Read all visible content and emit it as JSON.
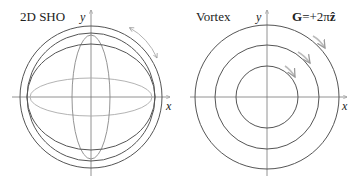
{
  "panels": [
    {
      "title": "2D SHO",
      "x_axis_label": "x",
      "y_axis_label": "y",
      "center": [
        91,
        97
      ],
      "curves": [
        {
          "type": "circle",
          "r": 71,
          "color": "#555555"
        },
        {
          "type": "circle",
          "r": 64,
          "color": "#555555"
        },
        {
          "type": "ellipse",
          "rx": 64,
          "ry": 53,
          "color": "#555555"
        },
        {
          "type": "ellipse",
          "rx": 19,
          "ry": 62,
          "color": "#888888"
        },
        {
          "type": "ellipse",
          "rx": 61,
          "ry": 19,
          "color": "#aaaaaa"
        }
      ],
      "annotation": "double-headed-arrow"
    },
    {
      "title": "Vortex",
      "x_axis_label": "x",
      "y_axis_label": "y",
      "formula": "G=+2πẑ",
      "formula_bold_part": "G",
      "formula_rest": "=+2π",
      "formula_vec": "ẑ",
      "center": [
        267,
        97
      ],
      "curves": [
        {
          "type": "circle",
          "r": 72,
          "color": "#555555"
        },
        {
          "type": "circle",
          "r": 52,
          "color": "#555555"
        },
        {
          "type": "circle",
          "r": 31,
          "color": "#555555"
        }
      ],
      "annotation": "clockwise-arrows"
    }
  ],
  "colors": {
    "axis": "#777777",
    "curve_dark": "#555555",
    "curve_mid": "#888888",
    "curve_light": "#aaaaaa",
    "arrow": "#bbbbbb"
  }
}
